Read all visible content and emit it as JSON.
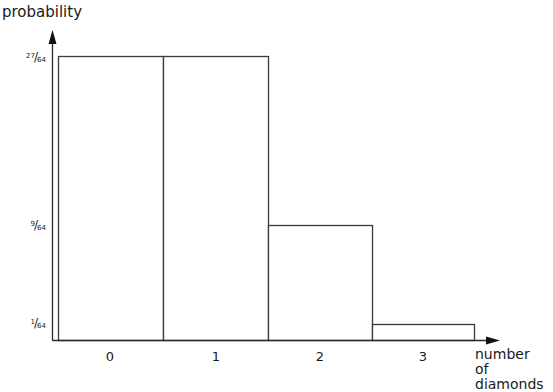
{
  "chart_data": {
    "type": "bar",
    "title": "",
    "xlabel": "number of diamonds",
    "ylabel": "probability",
    "categories": [
      "0",
      "1",
      "2",
      "3"
    ],
    "values": [
      0.421875,
      0.421875,
      0.140625,
      0.015625
    ],
    "values_fraction": [
      "27/64",
      "27/64",
      "9/64",
      "1/64"
    ],
    "yticks": [
      {
        "num": "27",
        "den": "64",
        "value": 0.421875
      },
      {
        "num": "9",
        "den": "64",
        "value": 0.140625
      },
      {
        "num": "1",
        "den": "64",
        "value": 0.015625
      }
    ],
    "ylim": [
      0,
      0.45
    ],
    "grid": false,
    "legend": null,
    "bar_style": {
      "fill": "#ffffff",
      "stroke": "#3a3a3a",
      "adjacent": true
    },
    "axis_color": "#2a2a2a",
    "layout_px": {
      "baseline_y": 340,
      "axis_x": 52,
      "y_arrow_tip": 30,
      "x_arrow_tip": 500,
      "bar_edges_x": [
        58,
        163,
        268,
        372,
        474
      ],
      "bar_tops_y": [
        56,
        56,
        225,
        324
      ]
    }
  },
  "labels": {
    "ylabel": "probability",
    "xlabel_line1": "number",
    "xlabel_line2": "of diamonds"
  }
}
